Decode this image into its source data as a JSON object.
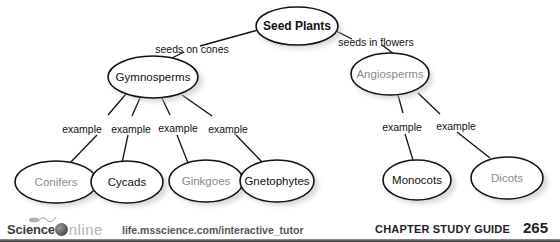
{
  "diagram": {
    "root": {
      "label": "Seed Plants",
      "style": "root"
    },
    "branches": [
      {
        "link_label": "seeds on cones",
        "node": {
          "label": "Gymnosperms",
          "style": "filled"
        },
        "children": [
          {
            "link_label": "example",
            "label": "Conifers",
            "style": "answer"
          },
          {
            "link_label": "example",
            "label": "Cycads",
            "style": "filled"
          },
          {
            "link_label": "example",
            "label": "Ginkgoes",
            "style": "answer"
          },
          {
            "link_label": "example",
            "label": "Gnetophytes",
            "style": "filled"
          }
        ]
      },
      {
        "link_label": "seeds in flowers",
        "node": {
          "label": "Angiosperms",
          "style": "answer"
        },
        "children": [
          {
            "link_label": "example",
            "label": "Monocots",
            "style": "filled"
          },
          {
            "link_label": "example",
            "label": "Dicots",
            "style": "answer"
          }
        ]
      }
    ],
    "colors": {
      "filled_text": "#111111",
      "answer_text": "#8a8a8a",
      "outline": "#111111"
    }
  },
  "footer": {
    "brand_science": "Science",
    "brand_online": "nline",
    "url": "life.msscience.com/interactive_tutor",
    "chapter_label": "CHAPTER STUDY GUIDE",
    "page_number": "265"
  }
}
